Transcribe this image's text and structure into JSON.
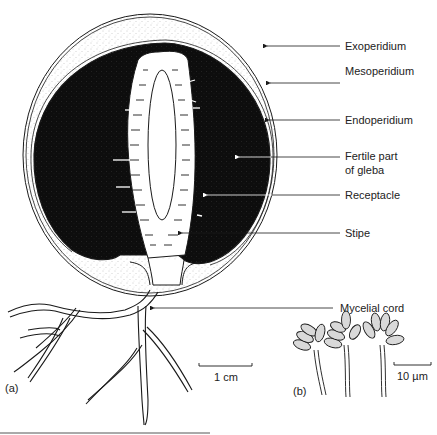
{
  "figure": {
    "panels": {
      "a": "(a)",
      "b": "(b)"
    },
    "labels": [
      {
        "id": "exoperidium",
        "text": "Exoperidium",
        "line_y": 46,
        "arrow_x": 265
      },
      {
        "id": "mesoperidium",
        "text": "Mesoperidium",
        "line_y": 83,
        "arrow_x": 268
      },
      {
        "id": "endoperidium",
        "text": "Endoperidium",
        "line_y": 120,
        "arrow_x": 267
      },
      {
        "id": "fertile-gleba",
        "text": "Fertile part",
        "text2": "of gleba",
        "line_y": 157,
        "arrow_x": 237
      },
      {
        "id": "receptacle",
        "text": "Receptacle",
        "line_y": 195,
        "arrow_x": 205
      },
      {
        "id": "stipe",
        "text": "Stipe",
        "line_y": 233,
        "arrow_x": 180
      },
      {
        "id": "mycelial-cord",
        "text": "Mycelial cord",
        "line_y": 308,
        "arrow_x": 152
      }
    ],
    "scale_bars": {
      "a": {
        "text": "1 cm"
      },
      "b": {
        "text": "10 µm"
      }
    },
    "colors": {
      "ink": "#1a1a1a",
      "gleba": "#0d0d0d",
      "stipple": "#8a8a8a",
      "spore": "#d9d9d9",
      "background": "#ffffff"
    }
  }
}
